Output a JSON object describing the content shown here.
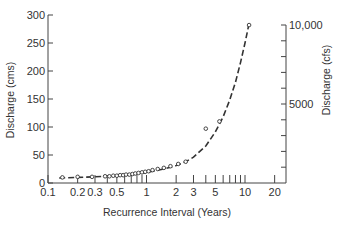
{
  "chart_data": {
    "type": "scatter",
    "title": "",
    "xlabel": "Recurrence Interval (Years)",
    "ylabel": "Discharge (cms)",
    "ylabel_right": "Discharge (cfs)",
    "xscale": "log",
    "xlim": [
      0.1,
      30
    ],
    "ylim": [
      0,
      300
    ],
    "x_ticks": [
      0.1,
      0.2,
      0.3,
      0.5,
      1,
      2,
      3,
      5,
      10,
      20
    ],
    "x_tick_labels": [
      "0.1",
      "0.2",
      "0.3",
      "0.5",
      "1",
      "2",
      "3",
      "5",
      "10",
      "20"
    ],
    "x_minor_ticks": [
      0.4,
      0.6,
      0.7,
      0.8,
      0.9,
      4,
      6,
      7,
      8,
      9
    ],
    "y_ticks": [
      0,
      50,
      100,
      150,
      200,
      250,
      300
    ],
    "y_tick_labels": [
      "0",
      "50",
      "100",
      "150",
      "200",
      "250",
      "300"
    ],
    "y_right_ticks_cfs": [
      1000,
      2000,
      3000,
      4000,
      5000,
      6000,
      7000,
      8000,
      9000,
      10000
    ],
    "y_right_tick_labels": {
      "5000": "5000",
      "10000": "10,000"
    },
    "grid": false,
    "legend": null,
    "series": [
      {
        "name": "observed",
        "marker": "open-circle",
        "x": [
          0.14,
          0.2,
          0.28,
          0.38,
          0.42,
          0.46,
          0.5,
          0.54,
          0.58,
          0.62,
          0.67,
          0.72,
          0.77,
          0.83,
          0.9,
          0.97,
          1.05,
          1.15,
          1.3,
          1.5,
          1.75,
          2.1,
          2.5,
          4.0,
          5.5,
          11.0
        ],
        "y": [
          10,
          11,
          11,
          12,
          12,
          13,
          13,
          14,
          14,
          15,
          15,
          16,
          17,
          18,
          19,
          20,
          21,
          23,
          25,
          27,
          30,
          34,
          38,
          97,
          110,
          282
        ]
      },
      {
        "name": "fitted curve",
        "style": "dashed",
        "x": [
          0.13,
          0.2,
          0.3,
          0.5,
          0.7,
          1,
          1.5,
          2,
          2.5,
          3,
          4,
          5,
          6,
          7,
          8,
          9,
          10,
          11
        ],
        "y": [
          9,
          10,
          11,
          13,
          15,
          19,
          25,
          31,
          38,
          46,
          66,
          91,
          118,
          148,
          180,
          215,
          250,
          285
        ]
      }
    ]
  }
}
